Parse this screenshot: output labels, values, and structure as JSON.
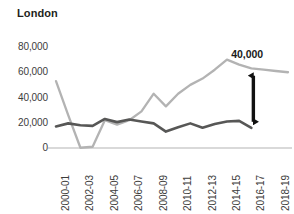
{
  "chart_data": {
    "type": "line",
    "title": "London",
    "xlabel": "",
    "ylabel": "",
    "ylim": [
      0,
      80000
    ],
    "ytick_labels": [
      "0",
      "20,000",
      "40,000",
      "60,000",
      "80,000"
    ],
    "ytick_values": [
      0,
      20000,
      40000,
      60000,
      80000
    ],
    "grid": false,
    "legend": "none",
    "x": [
      "2000-01",
      "2001-02",
      "2002-03",
      "2003-04",
      "2004-05",
      "2005-06",
      "2006-07",
      "2007-08",
      "2008-09",
      "2009-10",
      "2010-11",
      "2011-12",
      "2012-13",
      "2013-14",
      "2014-15",
      "2015-16",
      "2016-17",
      "2017-18",
      "2018-19",
      "2019-20"
    ],
    "xtick_labels": [
      "2000-01",
      "2002-03",
      "2004-05",
      "2006-07",
      "2008-09",
      "2010-11",
      "2012-13",
      "2014-15",
      "2016-17",
      "2018-19"
    ],
    "xtick_indices": [
      0,
      2,
      4,
      6,
      8,
      10,
      12,
      14,
      16,
      18
    ],
    "series": [
      {
        "name": "light-series",
        "color": "#b3b3b3",
        "values": [
          53000,
          26000,
          200,
          1000,
          22000,
          18500,
          22000,
          29000,
          43000,
          33000,
          43000,
          50000,
          55000,
          62000,
          70000,
          66000,
          63000,
          62000,
          61000,
          60000
        ]
      },
      {
        "name": "dark-series",
        "color": "#575756",
        "values": [
          17000,
          19500,
          18000,
          17500,
          23000,
          20500,
          22500,
          21000,
          19500,
          13000,
          16500,
          19500,
          16000,
          19000,
          21000,
          21500,
          16000,
          null,
          null,
          null
        ]
      }
    ],
    "annotations": [
      {
        "label": "40,000",
        "type": "double-arrow",
        "x_index": 16,
        "y_top": 62000,
        "y_bottom": 16000
      }
    ]
  },
  "axis": {
    "baseline_color": "#b3b3b3"
  }
}
